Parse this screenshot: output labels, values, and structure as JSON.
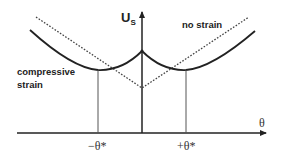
{
  "diagram": {
    "y_axis_label_main": "U",
    "y_axis_label_sub": "S",
    "x_axis_label": "θ",
    "tick_labels": {
      "neg": "−θ*",
      "pos": "+θ*"
    },
    "curve_labels": {
      "no_strain": "no strain",
      "compressive_line1": "compressive",
      "compressive_line2": "strain"
    },
    "colors": {
      "line": "#222222",
      "dotted": "#444444",
      "background": "#ffffff"
    }
  }
}
